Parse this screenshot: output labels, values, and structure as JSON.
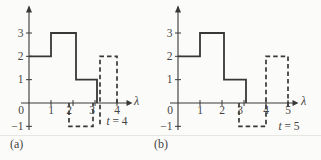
{
  "colors": {
    "background": "#fbfbf9",
    "ink": "#383838",
    "text": "#454545",
    "faint_rule": "#e6e6e2"
  },
  "chart_data": [
    {
      "type": "line",
      "style": "step-function",
      "caption": "(a)",
      "xlabel": "λ",
      "annotation": {
        "var": "t",
        "rest": " = 4"
      },
      "t_value": 4,
      "xlim": [
        0,
        4.7
      ],
      "ylim": [
        -1.5,
        4
      ],
      "grid": false,
      "x_ticks": [
        {
          "v": 0,
          "label": "0"
        },
        {
          "v": 1,
          "label": "1"
        },
        {
          "v": 2,
          "label": "2"
        },
        {
          "v": 3,
          "label": "3"
        },
        {
          "v": 4,
          "label": "4"
        }
      ],
      "y_ticks": [
        {
          "v": -1,
          "label": "−1"
        },
        {
          "v": 1,
          "label": "1"
        },
        {
          "v": 2,
          "label": "2"
        },
        {
          "v": 3,
          "label": "3"
        }
      ],
      "series": [
        {
          "name": "solid-step",
          "line": "solid",
          "segments": [
            {
              "x1": 0,
              "x2": 1,
              "y": 2
            },
            {
              "x1": 1,
              "x2": 2,
              "y": 3
            },
            {
              "x1": 2,
              "x2": 3,
              "y": 1
            }
          ]
        },
        {
          "name": "dashed-pulse",
          "line": "dashed",
          "segments": [
            {
              "x1": 2,
              "x2": 3,
              "y": -1
            },
            {
              "x1": 3,
              "x2": 4,
              "y": 2
            }
          ]
        }
      ]
    },
    {
      "type": "line",
      "style": "step-function",
      "caption": "(b)",
      "xlabel": "λ",
      "annotation": {
        "var": "t",
        "rest": " = 5"
      },
      "t_value": 5,
      "xlim": [
        0,
        5.7
      ],
      "ylim": [
        -1.5,
        4
      ],
      "grid": false,
      "x_ticks": [
        {
          "v": 0,
          "label": "0"
        },
        {
          "v": 1,
          "label": "1"
        },
        {
          "v": 2,
          "label": "2"
        },
        {
          "v": 3,
          "label": "3"
        },
        {
          "v": 4,
          "label": "4"
        },
        {
          "v": 5,
          "label": "5"
        }
      ],
      "y_ticks": [
        {
          "v": -1,
          "label": "−1"
        },
        {
          "v": 1,
          "label": "1"
        },
        {
          "v": 2,
          "label": "2"
        },
        {
          "v": 3,
          "label": "3"
        }
      ],
      "series": [
        {
          "name": "solid-step",
          "line": "solid",
          "segments": [
            {
              "x1": 0,
              "x2": 1,
              "y": 2
            },
            {
              "x1": 1,
              "x2": 2,
              "y": 3
            },
            {
              "x1": 2,
              "x2": 3,
              "y": 1
            }
          ]
        },
        {
          "name": "dashed-pulse",
          "line": "dashed",
          "segments": [
            {
              "x1": 3,
              "x2": 4,
              "y": -1
            },
            {
              "x1": 4,
              "x2": 5,
              "y": 2
            }
          ]
        }
      ]
    }
  ]
}
